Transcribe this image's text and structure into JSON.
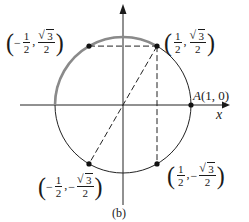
{
  "figure": {
    "caption": "(b)",
    "axes": {
      "x_label": "x",
      "y_label": ""
    },
    "circle": {
      "type": "unit circle",
      "center": [
        0,
        0
      ],
      "radius": 1,
      "highlighted_arc": {
        "from_angle_deg": 60,
        "to_angle_deg": 180,
        "color": "#8a8a8a"
      },
      "circle_color": "#222222"
    },
    "points": [
      {
        "id": "A",
        "label_name": "A",
        "label_coords": "(1, 0)",
        "x": 1,
        "y": 0
      },
      {
        "id": "p1",
        "x_num": "1",
        "x_den": "2",
        "x_sign": "",
        "y_num": "3",
        "y_den": "2",
        "y_sign": "",
        "x": 0.5,
        "y": 0.866
      },
      {
        "id": "p2",
        "x_num": "1",
        "x_den": "2",
        "x_sign": "−",
        "y_num": "3",
        "y_den": "2",
        "y_sign": "",
        "x": -0.5,
        "y": 0.866
      },
      {
        "id": "p3",
        "x_num": "1",
        "x_den": "2",
        "x_sign": "−",
        "y_num": "3",
        "y_den": "2",
        "y_sign": "−",
        "x": -0.5,
        "y": -0.866
      },
      {
        "id": "p4",
        "x_num": "1",
        "x_den": "2",
        "x_sign": "",
        "y_num": "3",
        "y_den": "2",
        "y_sign": "−",
        "x": 0.5,
        "y": -0.866
      }
    ],
    "dashed_segments": [
      {
        "from": "p2",
        "to": "p1",
        "desc": "horizontal chord"
      },
      {
        "from": "p1",
        "to": "p4",
        "desc": "vertical chord"
      },
      {
        "from": "p1",
        "to": "p3",
        "desc": "diameter through origin"
      }
    ],
    "punctuation": {
      "open": "(",
      "close": ")",
      "comma": ","
    }
  }
}
